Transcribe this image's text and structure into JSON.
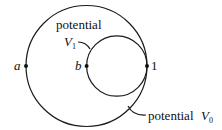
{
  "diagram": {
    "type": "concentric-tangent-circles",
    "outer_circle": {
      "label_prefix": "potential",
      "label_symbol": "V",
      "label_subscript": "0"
    },
    "inner_circle": {
      "label_prefix": "potential",
      "label_symbol": "V",
      "label_subscript": "1"
    },
    "points": [
      {
        "id": "a",
        "label": "a",
        "on": "outer circle (leftmost)"
      },
      {
        "id": "b",
        "label": "b",
        "on": "inner circle (leftmost)"
      },
      {
        "id": "1",
        "label": "1",
        "on": "tangent point (rightmost)"
      }
    ]
  }
}
